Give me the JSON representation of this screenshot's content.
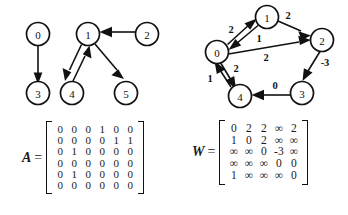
{
  "figure": {
    "caption": "",
    "panels": [
      "graph-left",
      "graph-right",
      "matrix-a",
      "matrix-w"
    ]
  },
  "graph_left": {
    "title": "",
    "type": "directed-unweighted-graph",
    "nodes": [
      {
        "id": "0",
        "label": "0",
        "cx": 38,
        "cy": 34
      },
      {
        "id": "1",
        "label": "1",
        "cx": 88,
        "cy": 34
      },
      {
        "id": "2",
        "label": "2",
        "cx": 147,
        "cy": 34
      },
      {
        "id": "3",
        "label": "3",
        "cx": 38,
        "cy": 93
      },
      {
        "id": "4",
        "label": "4",
        "cx": 72,
        "cy": 93
      },
      {
        "id": "5",
        "label": "5",
        "cx": 126,
        "cy": 93
      }
    ],
    "edges": [
      {
        "from": "0",
        "to": "3",
        "label": ""
      },
      {
        "from": "1",
        "to": "4",
        "label": ""
      },
      {
        "from": "1",
        "to": "5",
        "label": ""
      },
      {
        "from": "2",
        "to": "1",
        "label": ""
      },
      {
        "from": "4",
        "to": "1",
        "label": ""
      }
    ]
  },
  "graph_right": {
    "title": "",
    "type": "directed-weighted-graph",
    "nodes": [
      {
        "id": "0",
        "label": "0",
        "cx": 43,
        "cy": 52
      },
      {
        "id": "1",
        "label": "1",
        "cx": 93,
        "cy": 17
      },
      {
        "id": "2",
        "label": "2",
        "cx": 148,
        "cy": 40
      },
      {
        "id": "3",
        "label": "3",
        "cx": 128,
        "cy": 93
      },
      {
        "id": "4",
        "label": "4",
        "cx": 66,
        "cy": 96
      }
    ],
    "edges": [
      {
        "from": "0",
        "to": "1",
        "label": "2"
      },
      {
        "from": "1",
        "to": "0",
        "label": "1"
      },
      {
        "from": "1",
        "to": "2",
        "label": "2"
      },
      {
        "from": "0",
        "to": "2",
        "label": "2"
      },
      {
        "from": "2",
        "to": "3",
        "label": "-3"
      },
      {
        "from": "3",
        "to": "4",
        "label": "0"
      },
      {
        "from": "0",
        "to": "4",
        "label": "2"
      },
      {
        "from": "4",
        "to": "0",
        "label": "1"
      }
    ]
  },
  "matrix_a": {
    "name": "A",
    "equals": "=",
    "rows": [
      [
        "0",
        "0",
        "0",
        "1",
        "0",
        "0"
      ],
      [
        "0",
        "0",
        "0",
        "0",
        "1",
        "1"
      ],
      [
        "0",
        "1",
        "0",
        "0",
        "0",
        "0"
      ],
      [
        "0",
        "0",
        "0",
        "0",
        "0",
        "0"
      ],
      [
        "0",
        "1",
        "0",
        "0",
        "0",
        "0"
      ],
      [
        "0",
        "0",
        "0",
        "0",
        "0",
        "0"
      ]
    ]
  },
  "matrix_w": {
    "name": "W",
    "equals": "=",
    "rows": [
      [
        "0",
        "2",
        "2",
        "∞",
        "2"
      ],
      [
        "1",
        "0",
        "2",
        "∞",
        "∞"
      ],
      [
        "∞",
        "∞",
        "0",
        "-3",
        "∞"
      ],
      [
        "∞",
        "∞",
        "∞",
        "0",
        "0"
      ],
      [
        "1",
        "∞",
        "∞",
        "∞",
        "0"
      ]
    ]
  },
  "colors": {
    "ink": "#111111",
    "paper": "#ffffff"
  }
}
